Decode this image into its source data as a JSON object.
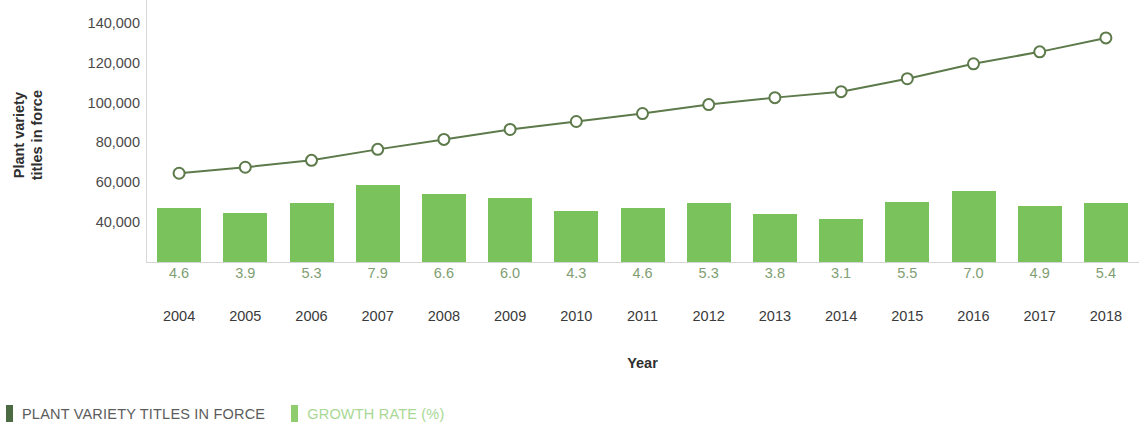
{
  "chart_data": {
    "type": "bar",
    "combo": true,
    "title": "",
    "xlabel": "Year",
    "ylabel": "Plant variety titles in force",
    "categories": [
      "2004",
      "2005",
      "2006",
      "2007",
      "2008",
      "2009",
      "2010",
      "2011",
      "2012",
      "2013",
      "2014",
      "2015",
      "2016",
      "2017",
      "2018"
    ],
    "ylim": [
      20000,
      140000
    ],
    "yticks": [
      140000,
      120000,
      100000,
      80000,
      60000,
      40000
    ],
    "ytick_labels": [
      "140,000",
      "120,000",
      "100,000",
      "80,000",
      "60,000",
      "40,000"
    ],
    "grid": false,
    "legend_position": "bottom-left",
    "series": [
      {
        "name": "PLANT VARIETY TITLES IN FORCE",
        "type": "line",
        "color": "#5d7a4b",
        "marker": "open-circle",
        "axis": "left",
        "values": [
          64500,
          67500,
          71000,
          76500,
          81500,
          86500,
          90500,
          94500,
          99000,
          102500,
          105500,
          112000,
          119500,
          125500,
          132500
        ]
      },
      {
        "name": "GROWTH RATE (%)",
        "type": "bar",
        "color": "#79c25c",
        "axis": "right",
        "values": [
          4.6,
          3.9,
          5.3,
          7.9,
          6.6,
          6.0,
          4.3,
          4.6,
          5.3,
          3.8,
          3.1,
          5.5,
          7.0,
          4.9,
          5.4
        ],
        "value_labels": [
          "4.6",
          "3.9",
          "5.3",
          "7.9",
          "6.6",
          "6.0",
          "4.3",
          "4.6",
          "5.3",
          "3.8",
          "3.1",
          "5.5",
          "7.0",
          "4.9",
          "5.4"
        ]
      }
    ]
  },
  "axes": {
    "y_title_line1": "Plant variety",
    "y_title_line2": "titles in force",
    "x_title": "Year"
  },
  "legend": {
    "items": [
      {
        "label": "PLANT VARIETY TITLES IN FORCE",
        "color": "#4d6b42",
        "text_color": "#5c5c5c"
      },
      {
        "label": "GROWTH RATE (%)",
        "color": "#8fcd6e",
        "text_color": "#a8d894"
      }
    ]
  },
  "colors": {
    "bar": "#79c25c",
    "line": "#5d7a4b",
    "marker_fill": "#ffffff",
    "axis": "#d5d5d5",
    "rate_label": "#7f9e72",
    "text": "#3a3a3a",
    "background": "#ffffff"
  }
}
